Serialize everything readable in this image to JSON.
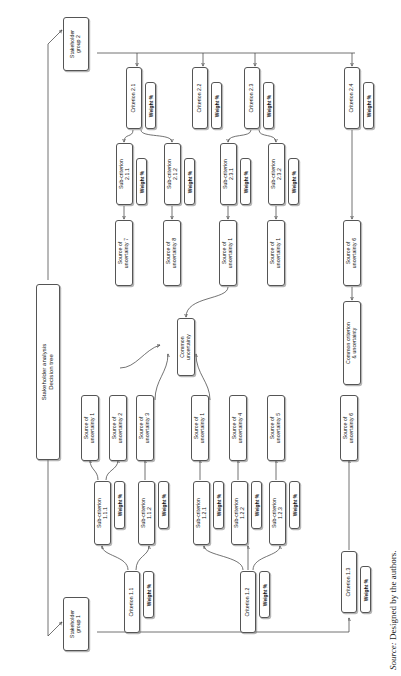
{
  "figure": {
    "caption_prefix": "Source:",
    "caption_text": "Designed by the authors.",
    "title_box": {
      "line1": "Stakeholder analysis",
      "line2": "Decision tree"
    }
  },
  "weight_label": "Weight %",
  "stakeholders": [
    {
      "id": "sg2",
      "line1": "Stakeholder",
      "line2": "group 2"
    },
    {
      "id": "sg1",
      "line1": "Stakeholder",
      "line2": "group 1"
    }
  ],
  "criteria": [
    {
      "id": "c21",
      "label": "Criterion 2.1",
      "weight": "Weight %"
    },
    {
      "id": "c22",
      "label": "Criterion 2.2",
      "weight": "Weight %"
    },
    {
      "id": "c23",
      "label": "Criterion 2.3",
      "weight": "Weight %"
    },
    {
      "id": "c24",
      "label": "Criterion 2.4",
      "weight": "Weight %"
    },
    {
      "id": "c11",
      "label": "Criterion 1.1",
      "weight": "Weight %"
    },
    {
      "id": "c12",
      "label": "Criterion 1.2",
      "weight": "Weight %"
    },
    {
      "id": "c13",
      "label": "Criterion 1.3",
      "weight": "Weight %"
    }
  ],
  "subcriteria": [
    {
      "id": "s211",
      "line1": "Sub-criterion",
      "line2": "2.1.1",
      "weight": "Weight %"
    },
    {
      "id": "s212",
      "line1": "Sub-criterion",
      "line2": "2.1.2",
      "weight": "Weight %"
    },
    {
      "id": "s231",
      "line1": "Sub-criterion",
      "line2": "2.3.1",
      "weight": "Weight %"
    },
    {
      "id": "s232",
      "line1": "Sub-criterion",
      "line2": "2.3.2",
      "weight": "Weight %"
    },
    {
      "id": "s111",
      "line1": "Sub-criterion",
      "line2": "1.1.1",
      "weight": "Weight %"
    },
    {
      "id": "s112",
      "line1": "Sub-criterion",
      "line2": "1.1.2",
      "weight": "Weight %"
    },
    {
      "id": "s121",
      "line1": "Sub-criterion",
      "line2": "1.2.1",
      "weight": "Weight %"
    },
    {
      "id": "s122",
      "line1": "Sub-criterion",
      "line2": "1.2.2",
      "weight": "Weight %"
    },
    {
      "id": "s123",
      "line1": "Sub-criterion",
      "line2": "1.2.3",
      "weight": "Weight %"
    }
  ],
  "sources": [
    {
      "id": "u7t",
      "line1": "Source of",
      "line2": "uncertainty 7"
    },
    {
      "id": "u8t",
      "line1": "Source of",
      "line2": "uncertainty 8"
    },
    {
      "id": "u1ta",
      "line1": "Source of",
      "line2": "uncertainty 1"
    },
    {
      "id": "u1tb",
      "line1": "Source of",
      "line2": "uncertainty 1"
    },
    {
      "id": "u6t",
      "line1": "Source of",
      "line2": "uncertainty 6"
    },
    {
      "id": "u1b",
      "line1": "Source of",
      "line2": "uncertainty 1"
    },
    {
      "id": "u2b",
      "line1": "Source of",
      "line2": "uncertainty 2"
    },
    {
      "id": "u3b",
      "line1": "Source of",
      "line2": "uncertainty 3"
    },
    {
      "id": "u1bb",
      "line1": "Source of",
      "line2": "uncertainty 1"
    },
    {
      "id": "u4b",
      "line1": "Source of",
      "line2": "uncertainty 4"
    },
    {
      "id": "u5b",
      "line1": "Source of",
      "line2": "uncertainty 5"
    },
    {
      "id": "u6b",
      "line1": "Source of",
      "line2": "uncertainty 6"
    }
  ],
  "common": [
    {
      "id": "cu",
      "line1": "Common",
      "line2": "uncertainty"
    },
    {
      "id": "ccu",
      "line1": "Common  criterion",
      "line2": "& uncertainty"
    }
  ]
}
